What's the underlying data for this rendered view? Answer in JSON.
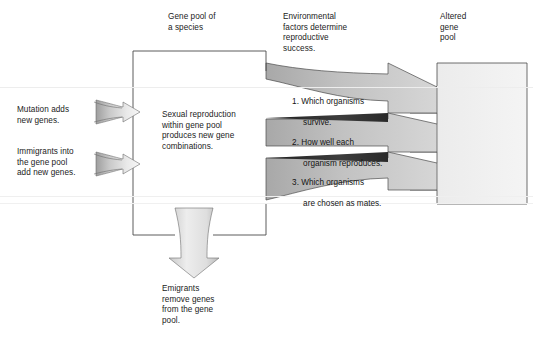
{
  "diagram": {
    "title_alt": "Gene pool change flow diagram",
    "colors": {
      "outline": "#4a4a4a",
      "text": "#1b1b1b",
      "arrow_light": "#f2f2f2",
      "arrow_mid": "#bfbfbf",
      "arrow_dark": "#9a9a9a",
      "wedge_dark": "#3a3a3a",
      "pool_fill_light": "#f1f1f1",
      "pool_fill_mid": "#d9d9d9",
      "background": "#ffffff"
    },
    "headings": {
      "gene_pool": "Gene pool of\na species",
      "environmental": "Environmental\nfactors determine\nreproductive\nsuccess.",
      "altered": "Altered\ngene\npool"
    },
    "center_box": {
      "text": "Sexual reproduction\nwithin gene pool\nproduces new gene\ncombinations."
    },
    "inputs": [
      {
        "id": "mutation",
        "label": "Mutation adds\nnew genes.",
        "arrow_name": "mutation-input-arrow"
      },
      {
        "id": "immigrants",
        "label": "Immigrants into\nthe gene pool\nadd new genes.",
        "arrow_name": "immigrants-input-arrow"
      }
    ],
    "output": {
      "id": "emigrants",
      "label": "Emigrants\nremove genes\nfrom the gene\npool.",
      "arrow_name": "emigrants-output-arrow"
    },
    "factors": [
      {
        "number": "1.",
        "line1": "Which organisms",
        "line2": "survive."
      },
      {
        "number": "2.",
        "line1": "How well each",
        "line2": "organism reproduces."
      },
      {
        "number": "3.",
        "line1": "Which organisms",
        "line2": "are chosen as mates."
      }
    ]
  }
}
